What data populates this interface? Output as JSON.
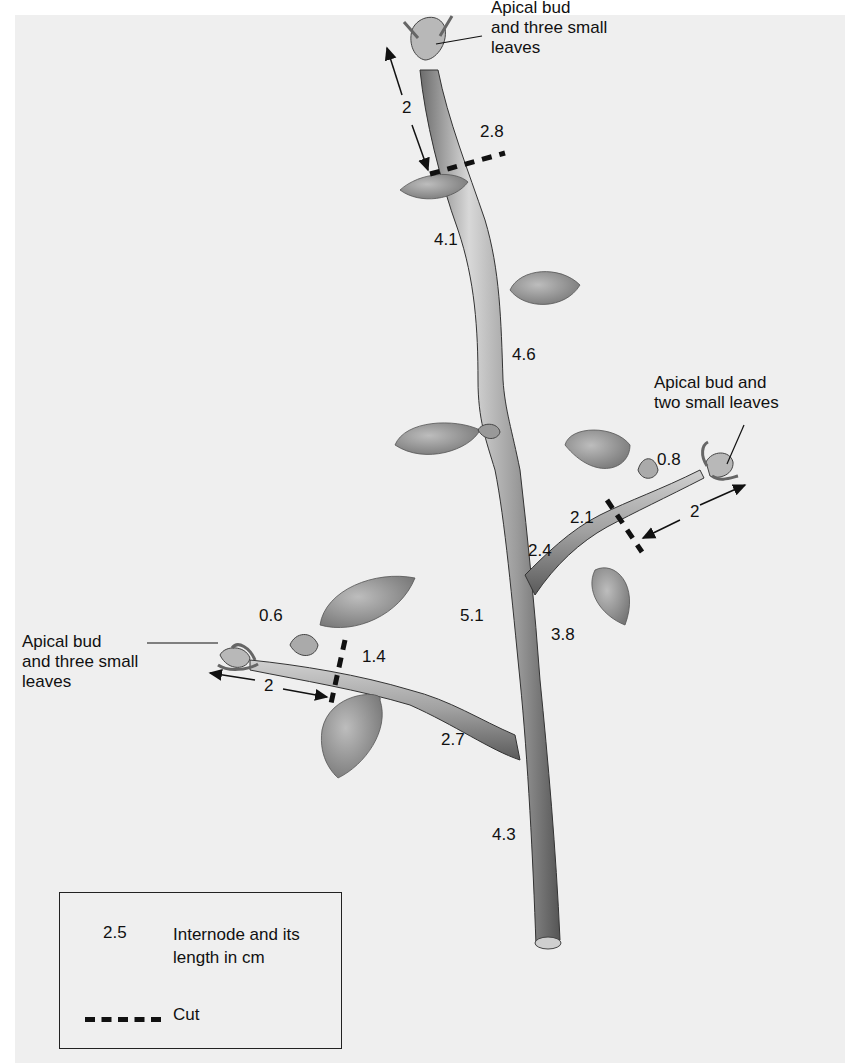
{
  "figure": {
    "type": "botanical-diagram"
  },
  "callouts": {
    "top_apical": [
      "Apical bud",
      "and three small",
      "leaves"
    ],
    "right_apical": [
      "Apical bud and",
      "two small leaves"
    ],
    "left_apical": [
      "Apical bud",
      "and three small",
      "leaves"
    ]
  },
  "internodes": {
    "top_segment": "2.8",
    "main_upper": "4.1",
    "main_middle": "4.6",
    "main_lower": "5.1",
    "main_base": "4.3",
    "right_tip": "0.8",
    "right_outer": "2.1",
    "right_inner": "2.4",
    "right_below": "3.8",
    "left_tip": "0.6",
    "left_outer": "1.4",
    "left_inner": "2.7"
  },
  "distances": {
    "top_arrow": "2",
    "right_arrow": "2",
    "left_arrow": "2"
  },
  "legend": {
    "sample_number": "2.5",
    "internode_desc": "Internode and its length in cm",
    "cut_label": "Cut"
  },
  "colors": {
    "panel": "#efefef",
    "stem": "#9a9a9a",
    "leaf": "#8e8e8e",
    "ink": "#111111"
  }
}
